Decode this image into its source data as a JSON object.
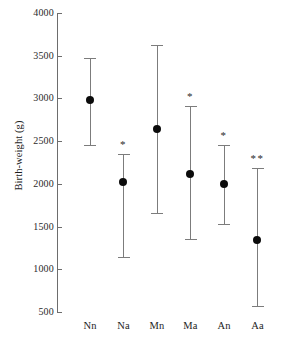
{
  "chart_data": {
    "type": "scatter",
    "title": "",
    "subtitle": "",
    "xlabel": "",
    "ylabel": "Birth-weight (g)",
    "ylim": [
      500,
      4000
    ],
    "ytick_labels": [
      "4000",
      "3500",
      "3000",
      "2500",
      "2000",
      "1500",
      "1000",
      "500"
    ],
    "yticks": [
      4000,
      3500,
      3000,
      2500,
      2000,
      1500,
      1000,
      500
    ],
    "grid": false,
    "legend": "none",
    "categories": [
      "Nn",
      "Na",
      "Mn",
      "Ma",
      "An",
      "Aa"
    ],
    "values": [
      2980,
      2020,
      2640,
      2110,
      2000,
      1340
    ],
    "error_low": [
      2460,
      1145,
      1655,
      1355,
      1530,
      575
    ],
    "error_high": [
      3475,
      2345,
      3630,
      2910,
      2450,
      2190
    ],
    "annotations": [
      "",
      "*",
      "",
      "*",
      "*",
      "**"
    ],
    "series": [
      {
        "name": "Birth-weight",
        "points": [
          {
            "category": "Nn",
            "mean": 2980,
            "low": 2460,
            "high": 3475,
            "significance": ""
          },
          {
            "category": "Na",
            "mean": 2020,
            "low": 1145,
            "high": 2345,
            "significance": "*"
          },
          {
            "category": "Mn",
            "mean": 2640,
            "low": 1655,
            "high": 3630,
            "significance": ""
          },
          {
            "category": "Ma",
            "mean": 2110,
            "low": 1355,
            "high": 2910,
            "significance": "*"
          },
          {
            "category": "An",
            "mean": 2000,
            "low": 1530,
            "high": 2450,
            "significance": "*"
          },
          {
            "category": "Aa",
            "mean": 1340,
            "low": 575,
            "high": 2190,
            "significance": "**"
          }
        ]
      }
    ],
    "colors": {
      "marker": "#0b0b0b",
      "errorbar": "#7c7c7c",
      "axis": "#6d6d6d",
      "text": "#1d1d1d",
      "background": "#ffffff"
    }
  }
}
